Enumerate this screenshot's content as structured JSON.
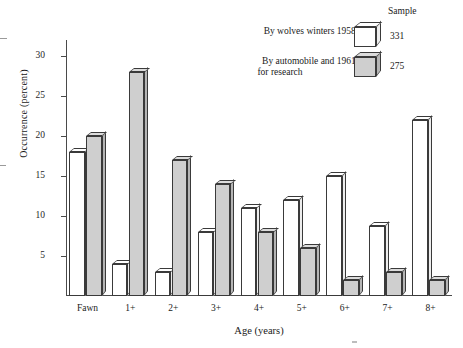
{
  "chart_data": {
    "type": "bar",
    "title": "",
    "xlabel": "Age (years)",
    "ylabel": "Occurrence (percent)",
    "categories": [
      "Fawn",
      "1+",
      "2+",
      "3+",
      "4+",
      "5+",
      "6+",
      "7+",
      "8+"
    ],
    "ylim": [
      0,
      32
    ],
    "yticks": [
      5,
      10,
      15,
      20,
      25,
      30
    ],
    "ytick_labels": [
      "5",
      "10",
      "15",
      "20",
      "25",
      "30"
    ],
    "grid": false,
    "legend_position": "top-right",
    "series": [
      {
        "name": "By wolves winters 1958–65",
        "sample": "331",
        "color": "#ffffff",
        "values": [
          18,
          4,
          3,
          8,
          11,
          12,
          15,
          8.7,
          22
        ]
      },
      {
        "name": "By automobile and 1961–65 for research",
        "sample": "275",
        "color": "#cfcfcf",
        "values": [
          20,
          28,
          17,
          14,
          8,
          6,
          2,
          3,
          2
        ]
      }
    ]
  },
  "axes": {
    "y_title": "Occurrence (percent)",
    "x_title": "Age (years)"
  },
  "legend": {
    "sample_header": "Sample",
    "rows": [
      {
        "line1": "By wolves winters 1958–65",
        "line2": "",
        "sample": "331",
        "swatch": "white-cube-icon"
      },
      {
        "line1": "By automobile and 1961–65",
        "line2": "for research",
        "sample": "275",
        "swatch": "gray-cube-icon"
      }
    ]
  }
}
